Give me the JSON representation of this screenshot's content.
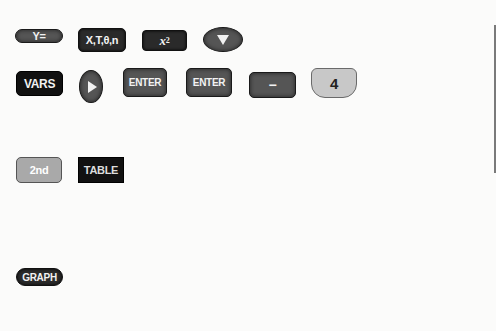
{
  "row1": {
    "y_equals": "Y=",
    "xt_theta_n": "X,T,θ,n",
    "x_squared_base": "x",
    "x_squared_exp": "2",
    "down_arrow": "down-arrow-icon"
  },
  "row2": {
    "vars": "VARS",
    "right_arrow": "right-arrow-icon",
    "enter_1": "ENTER",
    "enter_2": "ENTER",
    "minus": "−",
    "four": "4"
  },
  "row3": {
    "second": "2nd",
    "table": "TABLE"
  },
  "row4": {
    "graph": "GRAPH"
  },
  "colors": {
    "background": "#fbfbfa",
    "dark_key": "#2a2a2a",
    "mid_key": "#555555",
    "light_key": "#a9a9a9",
    "number_key": "#c8c8c8"
  }
}
